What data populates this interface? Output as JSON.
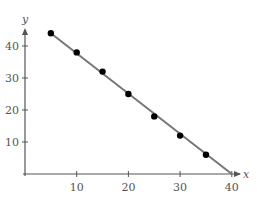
{
  "chart_data": {
    "type": "scatter",
    "title": "",
    "xlabel": "x",
    "ylabel": "y",
    "xlim": [
      0,
      41
    ],
    "ylim": [
      0,
      47
    ],
    "xticks": [
      10,
      20,
      30,
      40
    ],
    "yticks": [
      10,
      20,
      30,
      40
    ],
    "grid": false,
    "legend": null,
    "series": [
      {
        "name": "data points",
        "type": "scatter",
        "x": [
          5,
          10,
          15,
          20,
          25,
          30,
          35
        ],
        "y": [
          44,
          38,
          32,
          25,
          18,
          12,
          6
        ]
      },
      {
        "name": "fitted line",
        "type": "line",
        "x": [
          5,
          40
        ],
        "y": [
          44,
          0
        ]
      }
    ],
    "colors": {
      "line": "#777777",
      "points": "#000000",
      "axes": "#555555"
    }
  }
}
